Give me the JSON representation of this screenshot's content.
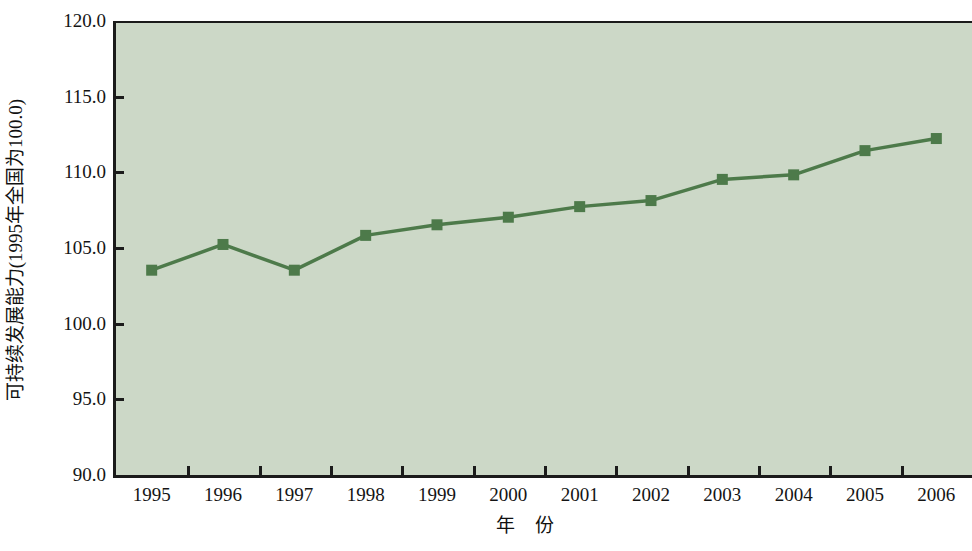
{
  "chart_data": {
    "type": "line",
    "title": "",
    "subtitle": "",
    "xlabel": "年  份",
    "ylabel": "可持续发展能力(1995年全国为100.0)",
    "categories": [
      "1995",
      "1996",
      "1997",
      "1998",
      "1999",
      "2000",
      "2001",
      "2002",
      "2003",
      "2004",
      "2005",
      "2006"
    ],
    "values": [
      103.6,
      105.3,
      103.6,
      105.9,
      106.6,
      107.1,
      107.8,
      108.2,
      109.6,
      109.9,
      111.5,
      112.3
    ],
    "series": [
      {
        "name": "可持续发展能力",
        "values": [
          103.6,
          105.3,
          103.6,
          105.9,
          106.6,
          107.1,
          107.8,
          108.2,
          109.6,
          109.9,
          111.5,
          112.3
        ]
      }
    ],
    "ylim": [
      90.0,
      120.0
    ],
    "y_ticks": [
      "120.0",
      "115.0",
      "110.0",
      "105.0",
      "100.0",
      "95.0",
      "90.0"
    ],
    "y_tick_values": [
      120.0,
      115.0,
      110.0,
      105.0,
      100.0,
      95.0,
      90.0
    ],
    "x_tick_labels": [
      "1995",
      "1996",
      "1997",
      "1998",
      "1999",
      "2000",
      "2001",
      "2002",
      "2003",
      "2004",
      "2005",
      "2006"
    ],
    "grid": false,
    "legend": "none",
    "colors": {
      "line": "#4d7a4a",
      "marker": "#4d7a4a",
      "plot_background": "#ccd8c7",
      "axis": "#1b1b1b",
      "figure_background": "#ffffff",
      "text": "#141414"
    }
  }
}
